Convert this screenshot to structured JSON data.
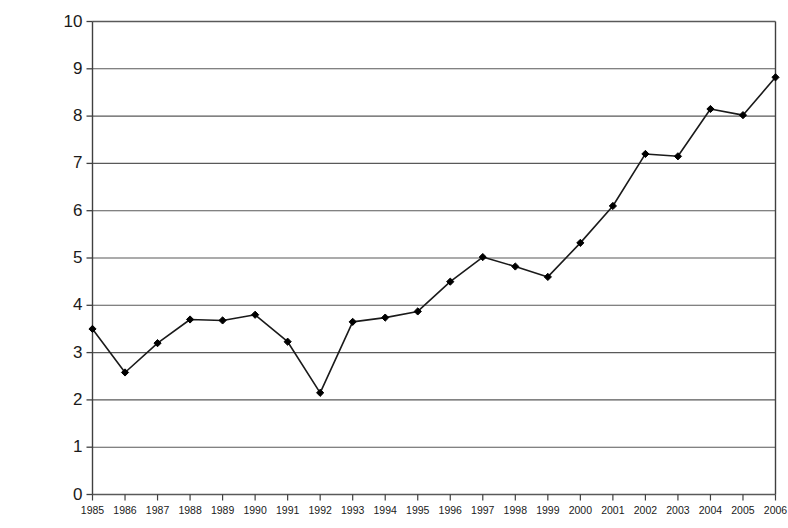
{
  "chart_data": {
    "type": "line",
    "title": "",
    "subtitle": "",
    "xlabel": "",
    "ylabel": "THC in %",
    "x": [
      1985,
      1986,
      1987,
      1988,
      1989,
      1990,
      1991,
      1992,
      1993,
      1994,
      1995,
      1996,
      1997,
      1998,
      1999,
      2000,
      2001,
      2002,
      2003,
      2004,
      2005,
      2006
    ],
    "categories": [
      "1985",
      "1986",
      "1987",
      "1988",
      "1989",
      "1990",
      "1991",
      "1992",
      "1993",
      "1994",
      "1995",
      "1996",
      "1997",
      "1998",
      "1999",
      "2000",
      "2001",
      "2002",
      "2003",
      "2004",
      "2005",
      "2006"
    ],
    "values": [
      3.5,
      2.58,
      3.2,
      3.7,
      3.68,
      3.8,
      3.23,
      2.15,
      3.65,
      3.74,
      3.87,
      4.5,
      5.02,
      4.82,
      4.6,
      5.32,
      6.1,
      7.2,
      7.15,
      8.15,
      8.02,
      8.82
    ],
    "series": [
      {
        "name": "THC in %",
        "values": [
          3.5,
          2.58,
          3.2,
          3.7,
          3.68,
          3.8,
          3.23,
          2.15,
          3.65,
          3.74,
          3.87,
          4.5,
          5.02,
          4.82,
          4.6,
          5.32,
          6.1,
          7.2,
          7.15,
          8.15,
          8.02,
          8.82
        ]
      }
    ],
    "ylim": [
      0,
      10
    ],
    "yticks": [
      0,
      1,
      2,
      3,
      4,
      5,
      6,
      7,
      8,
      9,
      10
    ],
    "ytick_labels": [
      "0",
      "1",
      "2",
      "3",
      "4",
      "5",
      "6",
      "7",
      "8",
      "9",
      "10"
    ],
    "xtick_labels": [
      "1985",
      "1986",
      "1987",
      "1988",
      "1989",
      "1990",
      "1991",
      "1992",
      "1993",
      "1994",
      "1995",
      "1996",
      "1997",
      "1998",
      "1999",
      "2000",
      "2001",
      "2002",
      "2003",
      "2004",
      "2005",
      "2006"
    ],
    "grid": "horizontal",
    "legend": "none",
    "marker": "diamond",
    "line_color": "#1a1a1a",
    "marker_color": "#000000",
    "grid_color": "#595959",
    "axis_color": "#404040",
    "background_color": "#ffffff"
  }
}
